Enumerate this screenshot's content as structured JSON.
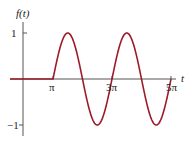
{
  "chart_data": {
    "type": "line",
    "title": "",
    "xlabel": "t",
    "ylabel": "f(t)",
    "xticks": [
      "π",
      "3π",
      "5π"
    ],
    "yticks": [
      "1",
      "−1"
    ],
    "ylim": [
      -1,
      1
    ],
    "xlim": [
      0,
      "5π"
    ],
    "series": [
      {
        "name": "f(t)",
        "color": "#9b1b2a",
        "definition": "f(t)=0 for t<π; f(t)=sin(t−π)·(−1)... shown as sin wave of amplitude 1 starting at π, period 2π... peaks at ~1.5π and ~3.5π, troughs at ~2.5π and ~4.5π",
        "points": [
          {
            "t": "0",
            "f": 0
          },
          {
            "t": "π",
            "f": 0
          },
          {
            "t": "1.5π",
            "f": 1
          },
          {
            "t": "2π",
            "f": 0
          },
          {
            "t": "2.5π",
            "f": -1
          },
          {
            "t": "3π",
            "f": 0
          },
          {
            "t": "3.5π",
            "f": 1
          },
          {
            "t": "4π",
            "f": 0
          },
          {
            "t": "4.5π",
            "f": -1
          },
          {
            "t": "5π",
            "f": 0
          }
        ]
      }
    ],
    "grid": false,
    "legend": null
  },
  "labels": {
    "ylabel": "f(t)",
    "xlabel": "t",
    "y1": "1",
    "ym1": "−1",
    "x1": "π",
    "x3": "3π",
    "x5": "5π"
  }
}
